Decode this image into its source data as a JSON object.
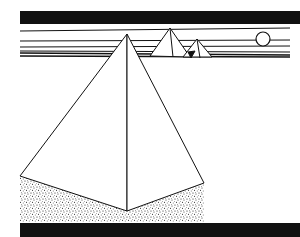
{
  "image": {
    "subject": "line drawing of pyramids in a desert",
    "background_color": "#ffffff",
    "ink_color": "#111111"
  },
  "elements": {
    "top_bar": "black band",
    "bottom_bar": "black band",
    "horizon_lines": "horizontal sky stripes",
    "sun": "circle",
    "small_pyramids": 2,
    "large_pyramid": 1,
    "sand": "stippled ground"
  }
}
